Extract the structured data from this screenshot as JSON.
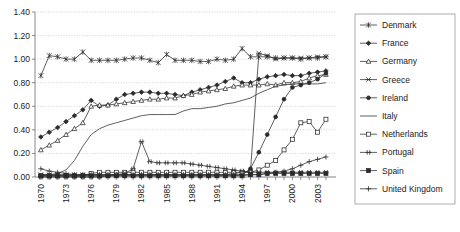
{
  "chart_data": {
    "type": "line",
    "title": "",
    "xlabel": "",
    "ylabel": "",
    "xlim": [
      1969.3,
      2005.2
    ],
    "ylim": [
      0.0,
      1.4
    ],
    "grid": true,
    "legend_position": "right",
    "y_ticks": [
      "0.00",
      "0.20",
      "0.40",
      "0.60",
      "0.80",
      "1.00",
      "1.20",
      "1.40"
    ],
    "y_tick_values": [
      0.0,
      0.2,
      0.4,
      0.6,
      0.8,
      1.0,
      1.2,
      1.4
    ],
    "x_ticks": [
      "1970",
      "1973",
      "1976",
      "1979",
      "1982",
      "1985",
      "1988",
      "1991",
      "1994",
      "1997",
      "2000",
      "2003"
    ],
    "x_tick_values": [
      1970,
      1973,
      1976,
      1979,
      1982,
      1985,
      1988,
      1991,
      1994,
      1997,
      2000,
      2003
    ],
    "x": [
      1970,
      1971,
      1972,
      1973,
      1974,
      1975,
      1976,
      1977,
      1978,
      1979,
      1980,
      1981,
      1982,
      1983,
      1984,
      1985,
      1986,
      1987,
      1988,
      1989,
      1990,
      1991,
      1992,
      1993,
      1994,
      1995,
      1996,
      1997,
      1998,
      1999,
      2000,
      2001,
      2002,
      2003,
      2004
    ],
    "series": [
      {
        "name": "Denmark",
        "marker": "asterisk",
        "values": [
          0.86,
          1.03,
          1.02,
          1.0,
          1.0,
          1.06,
          0.99,
          0.99,
          0.99,
          0.99,
          1.0,
          1.01,
          1.01,
          0.99,
          0.97,
          1.04,
          0.99,
          0.99,
          0.99,
          0.98,
          0.98,
          1.0,
          0.99,
          1.0,
          1.09,
          1.02,
          1.02,
          1.02,
          1.01,
          1.01,
          1.01,
          1.0,
          1.01,
          1.01,
          1.02
        ]
      },
      {
        "name": "France",
        "marker": "diamond-filled",
        "values": [
          0.34,
          0.38,
          0.42,
          0.47,
          0.52,
          0.57,
          0.65,
          0.6,
          0.61,
          0.66,
          0.7,
          0.71,
          0.72,
          0.72,
          0.71,
          0.71,
          0.7,
          0.69,
          0.72,
          0.74,
          0.76,
          0.78,
          0.81,
          0.84,
          0.8,
          0.8,
          0.83,
          0.85,
          0.86,
          0.87,
          0.86,
          0.86,
          0.88,
          0.89,
          0.9
        ]
      },
      {
        "name": "Germany",
        "marker": "triangle-open",
        "values": [
          0.23,
          0.27,
          0.31,
          0.36,
          0.41,
          0.46,
          0.6,
          0.61,
          0.61,
          0.62,
          0.63,
          0.64,
          0.65,
          0.66,
          0.66,
          0.67,
          0.67,
          0.69,
          0.7,
          0.72,
          0.73,
          0.74,
          0.75,
          0.77,
          0.78,
          0.78,
          0.78,
          0.79,
          0.78,
          0.8,
          0.8,
          0.81,
          0.84,
          0.86,
          0.87
        ]
      },
      {
        "name": "Greece",
        "marker": "x-star",
        "values": [
          0.02,
          0.02,
          0.02,
          0.02,
          0.02,
          0.02,
          0.02,
          0.02,
          0.02,
          0.02,
          0.02,
          0.02,
          0.02,
          0.02,
          0.02,
          0.02,
          0.02,
          0.02,
          0.02,
          0.02,
          0.02,
          0.02,
          0.02,
          0.03,
          0.04,
          0.05,
          1.05,
          1.03,
          1.0,
          1.01,
          1.01,
          1.01,
          1.01,
          1.02,
          1.02
        ]
      },
      {
        "name": "Ireland",
        "marker": "circle-filled",
        "values": [
          0.01,
          0.01,
          0.01,
          0.01,
          0.01,
          0.01,
          0.01,
          0.01,
          0.01,
          0.01,
          0.01,
          0.01,
          0.01,
          0.01,
          0.01,
          0.01,
          0.01,
          0.01,
          0.01,
          0.01,
          0.01,
          0.01,
          0.01,
          0.01,
          0.02,
          0.07,
          0.21,
          0.36,
          0.51,
          0.66,
          0.76,
          0.78,
          0.8,
          0.83,
          0.88
        ]
      },
      {
        "name": "Italy",
        "marker": "none",
        "values": [
          0.02,
          0.02,
          0.03,
          0.06,
          0.14,
          0.26,
          0.36,
          0.41,
          0.44,
          0.46,
          0.48,
          0.5,
          0.52,
          0.53,
          0.53,
          0.53,
          0.53,
          0.56,
          0.58,
          0.58,
          0.59,
          0.6,
          0.62,
          0.63,
          0.65,
          0.67,
          0.71,
          0.74,
          0.77,
          0.78,
          0.79,
          0.79,
          0.79,
          0.79,
          0.8
        ]
      },
      {
        "name": "Netherlands",
        "marker": "square-open",
        "values": [
          0.01,
          0.01,
          0.01,
          0.01,
          0.01,
          0.01,
          0.03,
          0.04,
          0.04,
          0.04,
          0.04,
          0.04,
          0.04,
          0.04,
          0.04,
          0.04,
          0.04,
          0.04,
          0.04,
          0.04,
          0.04,
          0.04,
          0.04,
          0.04,
          0.04,
          0.04,
          0.06,
          0.1,
          0.14,
          0.23,
          0.32,
          0.46,
          0.47,
          0.38,
          0.49
        ]
      },
      {
        "name": "Portugal",
        "marker": "hash",
        "values": [
          0.0,
          0.0,
          0.0,
          0.0,
          0.0,
          0.0,
          0.0,
          0.0,
          0.01,
          0.02,
          0.03,
          0.07,
          0.3,
          0.13,
          0.12,
          0.12,
          0.12,
          0.12,
          0.11,
          0.1,
          0.09,
          0.08,
          0.07,
          0.06,
          0.05,
          0.04,
          0.04,
          0.04,
          0.04,
          0.04,
          0.04,
          0.04,
          0.04,
          0.04,
          0.04
        ]
      },
      {
        "name": "Spain",
        "marker": "square-filled",
        "values": [
          0.01,
          0.01,
          0.01,
          0.01,
          0.01,
          0.01,
          0.01,
          0.01,
          0.01,
          0.01,
          0.01,
          0.01,
          0.01,
          0.01,
          0.01,
          0.01,
          0.01,
          0.01,
          0.01,
          0.01,
          0.01,
          0.01,
          0.01,
          0.01,
          0.01,
          0.02,
          0.02,
          0.03,
          0.03,
          0.03,
          0.03,
          0.03,
          0.03,
          0.03,
          0.03
        ]
      },
      {
        "name": "United Kingdom",
        "marker": "plus",
        "values": [
          0.07,
          0.05,
          0.04,
          0.03,
          0.02,
          0.02,
          0.02,
          0.02,
          0.02,
          0.02,
          0.02,
          0.02,
          0.02,
          0.02,
          0.02,
          0.02,
          0.02,
          0.02,
          0.02,
          0.02,
          0.02,
          0.02,
          0.02,
          0.02,
          0.02,
          0.02,
          0.02,
          0.03,
          0.04,
          0.05,
          0.07,
          0.1,
          0.13,
          0.15,
          0.17
        ]
      }
    ]
  },
  "legend": {
    "entries": [
      {
        "label": "Denmark"
      },
      {
        "label": "France"
      },
      {
        "label": "Germany"
      },
      {
        "label": "Greece"
      },
      {
        "label": "Ireland"
      },
      {
        "label": "Italy"
      },
      {
        "label": "Netherlands"
      },
      {
        "label": "Portugal"
      },
      {
        "label": "Spain"
      },
      {
        "label": "United Kingdom"
      }
    ]
  },
  "colors": {
    "line": "#2b2b2b",
    "grid": "#bdbdbd",
    "axis": "#8a8a8a",
    "text": "#1a1a1a",
    "background": "#ffffff"
  }
}
